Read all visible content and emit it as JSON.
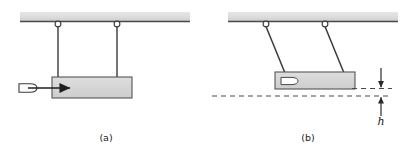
{
  "figure": {
    "background_color": "#ffffff",
    "ink_color": "#3a3a3a",
    "block_fill": "#d4d4d4",
    "ceiling_fill": "#d8d8d8",
    "bullet_fill": "#ffffff",
    "dash_color": "#4a4a4a"
  },
  "panels": [
    {
      "id": "panel-a",
      "caption": "(a)",
      "caption_x": 106,
      "caption_y": 141,
      "description": "Bullet approaching a suspended block, strings vertical",
      "ceiling": {
        "x": 20,
        "y": 12,
        "width": 170,
        "height": 9
      },
      "supports": [
        {
          "name": "left-string",
          "top_x": 58,
          "top_y": 26,
          "bottom_x": 58,
          "bottom_y": 77
        },
        {
          "name": "right-string",
          "top_x": 117,
          "top_y": 26,
          "bottom_x": 117,
          "bottom_y": 77
        }
      ],
      "rings": [
        {
          "cx": 58,
          "cy": 24,
          "r": 3
        },
        {
          "cx": 117,
          "cy": 24,
          "r": 3
        }
      ],
      "block": {
        "x": 52,
        "y": 77,
        "width": 80,
        "height": 21
      },
      "bullet": {
        "cx": 27,
        "cy": 88,
        "rx": 9,
        "ry": 4.5
      },
      "arrow": {
        "x1": 27,
        "y1": 88,
        "x2": 66,
        "y2": 88
      }
    },
    {
      "id": "panel-b",
      "caption": "(b)",
      "caption_x": 308,
      "caption_y": 141,
      "description": "Block swung up with bullet embedded, rise height h marked",
      "ceiling": {
        "x": 228,
        "y": 12,
        "width": 170,
        "height": 9
      },
      "supports": [
        {
          "name": "left-string",
          "top_x": 266,
          "top_y": 26,
          "bottom_x": 285,
          "bottom_y": 72
        },
        {
          "name": "right-string",
          "top_x": 325,
          "top_y": 26,
          "bottom_x": 344,
          "bottom_y": 72
        }
      ],
      "rings": [
        {
          "cx": 266,
          "cy": 24,
          "r": 3
        },
        {
          "cx": 325,
          "cy": 24,
          "r": 3
        }
      ],
      "block": {
        "x": 275,
        "y": 72,
        "width": 80,
        "height": 17
      },
      "bullet": {
        "cx": 289,
        "cy": 81,
        "rx": 9,
        "ry": 4.5
      },
      "dashed_lines": [
        {
          "name": "upper-level-line",
          "x1": 352,
          "y1": 88,
          "x2": 390,
          "y2": 88
        },
        {
          "name": "lower-level-line",
          "x1": 212,
          "y1": 96,
          "x2": 390,
          "y2": 96
        }
      ],
      "dimension": {
        "label": "h",
        "label_x": 381,
        "label_y": 122,
        "upper_arrow": {
          "x": 381,
          "y_from": 70,
          "y_to": 88
        },
        "lower_arrow": {
          "x": 381,
          "y_from": 114,
          "y_to": 96
        }
      }
    }
  ]
}
